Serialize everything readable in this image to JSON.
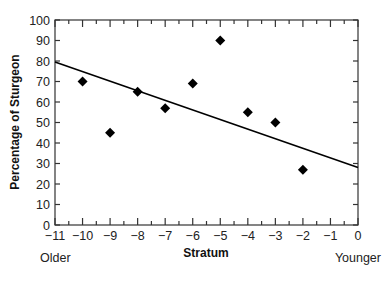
{
  "chart_data": {
    "type": "scatter",
    "title": "",
    "xlabel": "Stratum",
    "ylabel": "Percentage of Sturgeon",
    "xlim": [
      -11,
      0
    ],
    "ylim": [
      0,
      100
    ],
    "x_ticks": [
      -11,
      -10,
      -9,
      -8,
      -7,
      -6,
      -5,
      -4,
      -3,
      -2,
      -1,
      0
    ],
    "x_tick_labels": [
      "−11",
      "−10",
      "−9",
      "−8",
      "−7",
      "−6",
      "−5",
      "−4",
      "−3",
      "−2",
      "−1",
      "0"
    ],
    "y_ticks": [
      0,
      10,
      20,
      30,
      40,
      50,
      60,
      70,
      80,
      90,
      100
    ],
    "y_tick_labels": [
      "0",
      "10",
      "20",
      "30",
      "40",
      "50",
      "60",
      "70",
      "80",
      "90",
      "100"
    ],
    "grid": false,
    "series": [
      {
        "name": "Sturgeon percentage",
        "marker": "diamond",
        "color": "#000000",
        "points": [
          {
            "x": -10,
            "y": 70
          },
          {
            "x": -9,
            "y": 45
          },
          {
            "x": -8,
            "y": 65
          },
          {
            "x": -7,
            "y": 57
          },
          {
            "x": -6,
            "y": 69
          },
          {
            "x": -5,
            "y": 90
          },
          {
            "x": -4,
            "y": 55
          },
          {
            "x": -3,
            "y": 50
          },
          {
            "x": -2,
            "y": 27
          }
        ]
      }
    ],
    "trend_line": {
      "type": "linear",
      "from": {
        "x": -11,
        "y": 79.5
      },
      "to": {
        "x": 0,
        "y": 28
      },
      "color": "#000000"
    },
    "annotations": {
      "left": "Older",
      "right": "Younger"
    }
  }
}
